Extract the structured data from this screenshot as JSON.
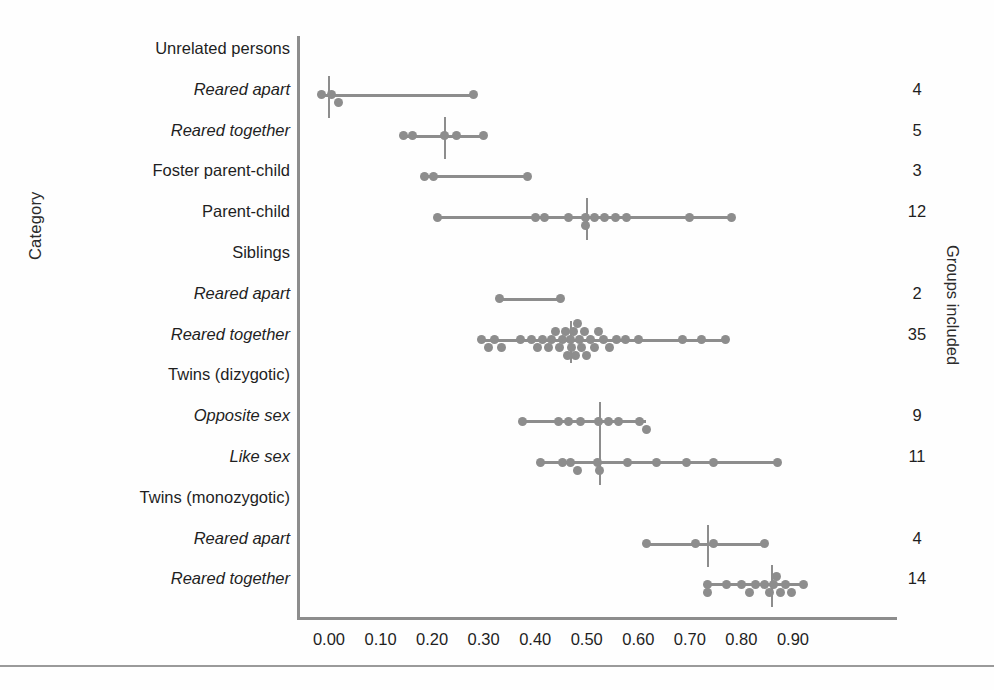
{
  "figure": {
    "background_color": "#fefefe",
    "mark_color": "#8d8d8d",
    "text_color": "#1f1f1f",
    "y_axis_title": "Category",
    "right_axis_title": "Groups included",
    "bottom_rule": true
  },
  "chart_data": {
    "type": "scatter",
    "title": "",
    "xlabel": "",
    "ylabel": "Category",
    "right_label": "Groups included",
    "xlim": [
      -0.05,
      0.95
    ],
    "xticks": [
      0.0,
      0.1,
      0.2,
      0.3,
      0.4,
      0.5,
      0.6,
      0.7,
      0.8,
      0.9
    ],
    "xticklabels": [
      "0.00",
      "0.10",
      "0.20",
      "0.30",
      "0.40",
      "0.50",
      "0.60",
      "0.70",
      "0.80",
      "0.90"
    ],
    "grid": false,
    "legend": "none",
    "categories": [
      {
        "label": "Unrelated persons",
        "italic": false,
        "header": true,
        "groups_included": "",
        "range": null,
        "median": null,
        "points": []
      },
      {
        "label": "Reared apart",
        "italic": true,
        "header": false,
        "groups_included": "4",
        "range": [
          -0.015,
          0.28
        ],
        "median": 0.0,
        "points": [
          -0.015,
          0.005,
          0.018,
          0.28
        ]
      },
      {
        "label": "Reared together",
        "italic": true,
        "header": false,
        "groups_included": "5",
        "range": [
          0.145,
          0.3
        ],
        "median": 0.225,
        "points": [
          0.145,
          0.162,
          0.225,
          0.248,
          0.3
        ]
      },
      {
        "label": "Foster parent-child",
        "italic": false,
        "header": false,
        "groups_included": "3",
        "range": [
          0.185,
          0.385
        ],
        "median": null,
        "points": [
          0.185,
          0.203,
          0.385
        ]
      },
      {
        "label": "Parent-child",
        "italic": false,
        "header": false,
        "groups_included": "12",
        "range": [
          0.21,
          0.78
        ],
        "median": 0.5,
        "points": [
          0.21,
          0.4,
          0.418,
          0.465,
          0.497,
          0.497,
          0.515,
          0.535,
          0.555,
          0.578,
          0.7,
          0.78
        ]
      },
      {
        "label": "Siblings",
        "italic": false,
        "header": true,
        "groups_included": "",
        "range": null,
        "median": null,
        "points": []
      },
      {
        "label": "Reared apart",
        "italic": true,
        "header": false,
        "groups_included": "2",
        "range": [
          0.33,
          0.45
        ],
        "median": null,
        "points": [
          0.33,
          0.45
        ]
      },
      {
        "label": "Reared together",
        "italic": true,
        "header": false,
        "groups_included": "35",
        "range": [
          0.295,
          0.77
        ],
        "median": 0.47,
        "points": [
          0.295,
          0.31,
          0.322,
          0.335,
          0.372,
          0.392,
          0.405,
          0.415,
          0.425,
          0.432,
          0.44,
          0.447,
          0.452,
          0.458,
          0.462,
          0.468,
          0.47,
          0.474,
          0.478,
          0.482,
          0.486,
          0.49,
          0.495,
          0.5,
          0.508,
          0.515,
          0.522,
          0.532,
          0.545,
          0.558,
          0.575,
          0.6,
          0.685,
          0.723,
          0.77
        ]
      },
      {
        "label": "Twins (dizygotic)",
        "italic": false,
        "header": true,
        "groups_included": "",
        "range": null,
        "median": null,
        "points": []
      },
      {
        "label": "Opposite sex",
        "italic": true,
        "header": false,
        "groups_included": "9",
        "range": [
          0.375,
          0.615
        ],
        "median": 0.525,
        "points": [
          0.375,
          0.445,
          0.465,
          0.487,
          0.522,
          0.543,
          0.562,
          0.602,
          0.615
        ]
      },
      {
        "label": "Like sex",
        "italic": true,
        "header": false,
        "groups_included": "11",
        "range": [
          0.41,
          0.87
        ],
        "median": 0.525,
        "points": [
          0.41,
          0.452,
          0.468,
          0.482,
          0.52,
          0.524,
          0.58,
          0.635,
          0.693,
          0.745,
          0.87
        ]
      },
      {
        "label": "Twins (monozygotic)",
        "italic": false,
        "header": true,
        "groups_included": "",
        "range": null,
        "median": null,
        "points": []
      },
      {
        "label": "Reared apart",
        "italic": true,
        "header": false,
        "groups_included": "4",
        "range": [
          0.615,
          0.845
        ],
        "median": 0.735,
        "points": [
          0.615,
          0.71,
          0.745,
          0.845
        ]
      },
      {
        "label": "Reared together",
        "italic": true,
        "header": false,
        "groups_included": "14",
        "range": [
          0.735,
          0.92
        ],
        "median": 0.86,
        "points": [
          0.735,
          0.735,
          0.772,
          0.8,
          0.815,
          0.828,
          0.845,
          0.855,
          0.862,
          0.868,
          0.875,
          0.885,
          0.898,
          0.92
        ]
      }
    ]
  }
}
